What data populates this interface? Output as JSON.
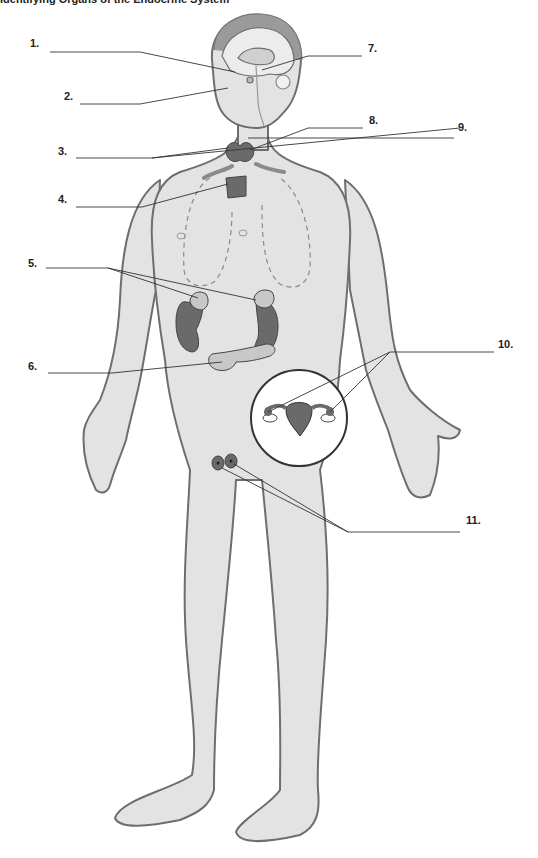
{
  "title": "Identifying Organs of the Endocrine System",
  "labels": [
    {
      "num": "1.",
      "x": 30,
      "y": 37
    },
    {
      "num": "2.",
      "x": 64,
      "y": 90
    },
    {
      "num": "3.",
      "x": 58,
      "y": 145
    },
    {
      "num": "4.",
      "x": 58,
      "y": 193
    },
    {
      "num": "5.",
      "x": 28,
      "y": 257
    },
    {
      "num": "6.",
      "x": 28,
      "y": 360
    },
    {
      "num": "7.",
      "x": 368,
      "y": 42
    },
    {
      "num": "8.",
      "x": 369,
      "y": 114
    },
    {
      "num": "9.",
      "x": 458,
      "y": 121
    },
    {
      "num": "10.",
      "x": 498,
      "y": 338
    },
    {
      "num": "11.",
      "x": 466,
      "y": 514
    }
  ],
  "colors": {
    "skin": "#e3e3e3",
    "outline": "#6e6e6e",
    "organ": "#6a6a6a",
    "organ_light": "#9a9a9a",
    "leader": "#333333"
  }
}
